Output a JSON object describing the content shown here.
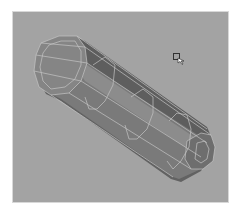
{
  "viewport": {
    "name": "3d-modeling-viewport",
    "background": "#a3a3a3",
    "border": "#d8d8d8"
  },
  "mesh": {
    "type": "capsule-polygon-mesh",
    "display": "shaded-with-wireframe",
    "colors": {
      "top_face": "#8e8e8e",
      "side_face": "#7a7a7a",
      "bottom_face": "#626262",
      "cap_face": "#858585",
      "wireframe": "#c4c4c4"
    }
  },
  "cursor": {
    "type": "select-arrow-cursor",
    "x": 172,
    "y": 52
  }
}
